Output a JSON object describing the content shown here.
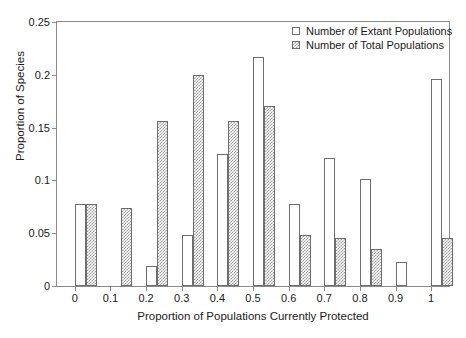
{
  "chart_data": {
    "type": "bar",
    "title": "",
    "xlabel": "Proportion of Populations Currently Protected",
    "ylabel": "Proportion of Species",
    "categories": [
      "0",
      "0.1",
      "0.2",
      "0.3",
      "0.4",
      "0.5",
      "0.6",
      "0.7",
      "0.8",
      "0.9",
      "1"
    ],
    "xlim": [
      -0.05,
      1.05
    ],
    "ylim": [
      0,
      0.25
    ],
    "yticks": [
      "0",
      "0.05",
      "0.1",
      "0.15",
      "0.2",
      "0.25"
    ],
    "ytick_values": [
      0,
      0.05,
      0.1,
      0.15,
      0.2,
      0.25
    ],
    "grid": false,
    "legend_position": "top-right",
    "series": [
      {
        "name": "Number of Extant Populations",
        "style": "open-white",
        "color": "#ffffff",
        "values": [
          0.078,
          0.0,
          0.019,
          0.048,
          0.125,
          0.217,
          0.078,
          0.121,
          0.101,
          0.023,
          0.196
        ]
      },
      {
        "name": "Number of Total Populations",
        "style": "hatched-gray",
        "color": "#9a9a9a",
        "values": [
          0.078,
          0.074,
          0.156,
          0.2,
          0.156,
          0.17,
          0.048,
          0.045,
          0.035,
          0.0,
          0.045
        ]
      }
    ]
  },
  "legend": {
    "items": [
      {
        "label": "Number of Extant Populations"
      },
      {
        "label": "Number of Total Populations"
      }
    ]
  }
}
